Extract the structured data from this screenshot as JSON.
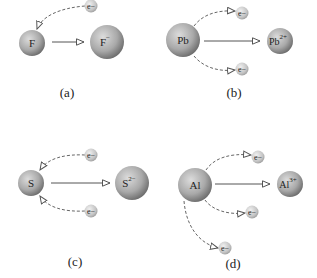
{
  "colors": {
    "atom_light": "#d6d6d6",
    "atom_dark": "#6e6e6e",
    "electron_light": "#e8e8e8",
    "electron_dark": "#9a9a9a",
    "arrow": "#555555",
    "text": "#222222"
  },
  "electron_label": "e−",
  "panels": [
    {
      "id": "a",
      "label": "(a)",
      "atom": "F",
      "ion": "F",
      "ion_charge": "−",
      "electrons": 1,
      "direction": "gain"
    },
    {
      "id": "b",
      "label": "(b)",
      "atom": "Pb",
      "ion": "Pb",
      "ion_charge": "2+",
      "electrons": 2,
      "direction": "loss"
    },
    {
      "id": "c",
      "label": "(c)",
      "atom": "S",
      "ion": "S",
      "ion_charge": "2−",
      "electrons": 2,
      "direction": "gain"
    },
    {
      "id": "d",
      "label": "(d)",
      "atom": "Al",
      "ion": "Al",
      "ion_charge": "3+",
      "electrons": 3,
      "direction": "loss"
    }
  ]
}
